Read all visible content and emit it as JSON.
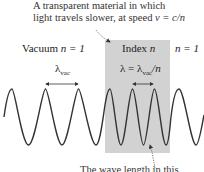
{
  "caption": {
    "line1": "A transparent material in which",
    "line2_prefix": "light travels slower, at speed ",
    "line2_formula": "v = c/n"
  },
  "labels": {
    "vacuum": "Vacuum ",
    "vacuum_n": "n = 1",
    "index": "Index ",
    "index_n": "n",
    "right_n": "n = 1",
    "lambda_vac": "λ",
    "lambda_vac_sub": "vac",
    "lambda_medium_prefix": "λ = λ",
    "lambda_medium_sub": "vac",
    "lambda_medium_suffix": "/n",
    "bottom_caption_partial": "The wave length in this"
  },
  "colors": {
    "medium_fill": "#d2d2d2",
    "wave": "#333333",
    "arrow": "#555555"
  },
  "wave": {
    "vacuum_wavelength_px": 33,
    "medium_wavelength_px": 22,
    "crest_y": 89,
    "trough_y": 145
  }
}
